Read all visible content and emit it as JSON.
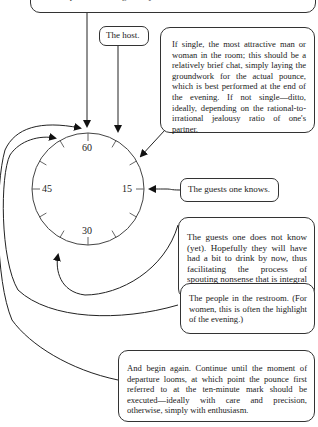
{
  "boxes": {
    "top": "famous person standing nearby.",
    "host": "The host.",
    "attractive": "If single, the most attractive man or woman in the room; this should be a relatively brief chat, simply laying the groundwork for the actual pounce, which is best performed at the end of the evening. If not single—ditto, ideally, depending on the rational-to-irrational jealousy ratio of one's partner.",
    "known": "The guests one knows.",
    "unknown": "The guests one does not know (yet). Hopefully they will have had a bit to drink by now, thus facilitating the process of spouting nonsense that is integral to events of this kind.",
    "restroom": "The people in the restroom. (For women, this is often the highlight of the evening.)",
    "again": "And begin again. Continue until the moment of departure looms, at which point the pounce first referred to at the ten-minute mark should be executed—ideally with care and precision, otherwise, simply with enthusiasm."
  },
  "clock": {
    "labels": {
      "top": "60",
      "right": "15",
      "bottom": "30",
      "left": "45"
    }
  }
}
